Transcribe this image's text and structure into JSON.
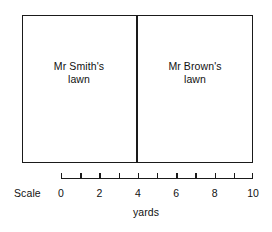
{
  "diagram": {
    "background_color": "#ffffff",
    "line_color": "#1a1a1a",
    "text_color": "#111111"
  },
  "plots": [
    {
      "name": "smith",
      "line1": "Mr Smith's",
      "line2": "lawn",
      "start_yards": 0,
      "end_yards": 4
    },
    {
      "name": "brown",
      "line1": "Mr Brown's",
      "line2": "lawn",
      "start_yards": 4,
      "end_yards": 10
    }
  ],
  "scale": {
    "label": "Scale",
    "units": "yards",
    "min": 0,
    "max": 10,
    "tick_step": 1,
    "label_step": 2,
    "ticks": [
      0,
      1,
      2,
      3,
      4,
      5,
      6,
      7,
      8,
      9,
      10
    ],
    "tick_labels": [
      "0",
      "2",
      "4",
      "6",
      "8",
      "10"
    ],
    "labeled_ticks": [
      0,
      2,
      4,
      6,
      8,
      10
    ],
    "divider_at_yards": 4
  },
  "chart_data": {
    "type": "bar",
    "categories": [
      "Mr Smith's lawn",
      "Mr Brown's lawn"
    ],
    "values": [
      4,
      6
    ],
    "xlabel": "yards",
    "ylabel": "",
    "xlim": [
      0,
      10
    ],
    "grid": false,
    "legend": "none",
    "annotations": [
      "Scale",
      "yards"
    ]
  }
}
